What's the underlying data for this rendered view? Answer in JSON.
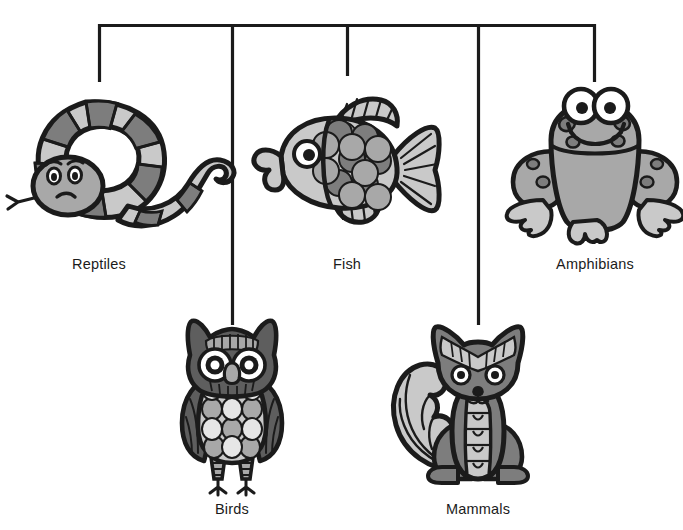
{
  "diagram": {
    "type": "classification-tree",
    "title_visible": false,
    "root_connector": {
      "name": "horizontal-trunk",
      "x_start": 99,
      "x_end": 595,
      "y": 25
    },
    "colors": {
      "stroke": "#1b1b1b",
      "background": "#ffffff",
      "light_gray": "#c9c9c9",
      "mid_gray": "#a8a8a8",
      "dark_gray": "#7d7d7d",
      "darker_gray": "#5e5e5e",
      "white": "#ffffff",
      "label_text": "#1b1b1b"
    },
    "branches": [
      {
        "id": "reptiles",
        "label": "Reptiles",
        "icon": "snake-icon",
        "connector_x": 99,
        "connector_y_end": 82,
        "label_x": 99,
        "label_y": 256,
        "illustration_center": {
          "x": 98,
          "y": 160
        }
      },
      {
        "id": "birds",
        "label": "Birds",
        "icon": "owl-icon",
        "connector_x": 232,
        "connector_y_end": 325,
        "label_x": 232,
        "label_y": 501,
        "illustration_center": {
          "x": 232,
          "y": 405
        }
      },
      {
        "id": "fish",
        "label": "Fish",
        "icon": "fish-icon",
        "connector_x": 347,
        "connector_y_end": 76,
        "label_x": 347,
        "label_y": 256,
        "illustration_center": {
          "x": 347,
          "y": 160
        }
      },
      {
        "id": "mammals",
        "label": "Mammals",
        "icon": "fox-icon",
        "connector_x": 478,
        "connector_y_end": 325,
        "label_x": 478,
        "label_y": 501,
        "illustration_center": {
          "x": 478,
          "y": 405
        }
      },
      {
        "id": "amphibians",
        "label": "Amphibians",
        "icon": "frog-icon",
        "connector_x": 595,
        "connector_y_end": 82,
        "label_x": 595,
        "label_y": 256,
        "illustration_center": {
          "x": 595,
          "y": 158
        }
      }
    ]
  }
}
